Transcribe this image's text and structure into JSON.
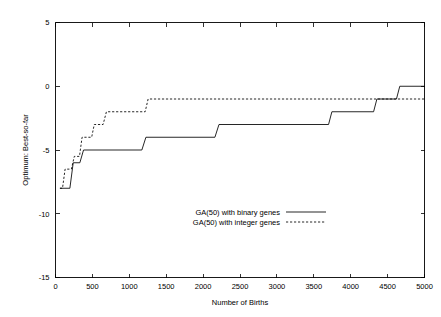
{
  "chart_data": {
    "type": "line",
    "title": "",
    "xlabel": "Number of Births",
    "ylabel": "Optimum: Best-so-far",
    "xlim": [
      0,
      5000
    ],
    "ylim": [
      -15,
      5
    ],
    "xticks": [
      0,
      500,
      1000,
      1500,
      2000,
      2500,
      3000,
      3500,
      4000,
      4500,
      5000
    ],
    "xtick_labels": [
      "0",
      "500",
      "1000",
      "1500",
      "2000",
      "2500",
      "3000",
      "3500",
      "4000",
      "4500",
      "5000"
    ],
    "yticks": [
      -15,
      -10,
      -5,
      0,
      5
    ],
    "ytick_labels": [
      "-15",
      "-10",
      "-5",
      "0",
      "5"
    ],
    "grid": false,
    "legend_position": "center",
    "series": [
      {
        "name": "GA(50) with binary genes",
        "style": "solid",
        "color": "#000000",
        "points": [
          [
            60,
            -8
          ],
          [
            195,
            -8
          ],
          [
            240,
            -6
          ],
          [
            330,
            -6
          ],
          [
            380,
            -5
          ],
          [
            1170,
            -5
          ],
          [
            1225,
            -4
          ],
          [
            2160,
            -4
          ],
          [
            2215,
            -3
          ],
          [
            3700,
            -3
          ],
          [
            3745,
            -2
          ],
          [
            4310,
            -2
          ],
          [
            4355,
            -1
          ],
          [
            4620,
            -1
          ],
          [
            4665,
            0
          ],
          [
            5000,
            0
          ]
        ]
      },
      {
        "name": "GA(50) with integer genes",
        "style": "dashed",
        "color": "#000000",
        "points": [
          [
            60,
            -8
          ],
          [
            95,
            -8
          ],
          [
            130,
            -6.5
          ],
          [
            215,
            -6.5
          ],
          [
            255,
            -5.5
          ],
          [
            325,
            -5.5
          ],
          [
            360,
            -4
          ],
          [
            490,
            -4
          ],
          [
            525,
            -3
          ],
          [
            645,
            -3
          ],
          [
            690,
            -2
          ],
          [
            1215,
            -2
          ],
          [
            1255,
            -1
          ],
          [
            5000,
            -1
          ]
        ]
      }
    ]
  },
  "legend": {
    "entries": [
      {
        "label": "GA(50) with binary genes",
        "style": "solid"
      },
      {
        "label": "GA(50) with integer genes",
        "style": "dashed"
      }
    ]
  }
}
